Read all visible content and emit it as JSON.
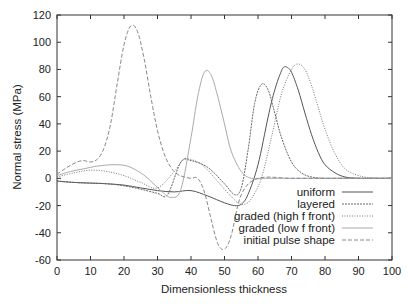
{
  "chart_data": {
    "type": "line",
    "title": "",
    "xlabel": "Dimensionless thickness",
    "ylabel": "Normal stress (MPa)",
    "xlim": [
      0,
      100
    ],
    "ylim": [
      -60,
      120
    ],
    "xticks": [
      0,
      10,
      20,
      30,
      40,
      50,
      60,
      70,
      80,
      90,
      100
    ],
    "yticks": [
      -60,
      -40,
      -20,
      0,
      20,
      40,
      60,
      80,
      100,
      120
    ],
    "grid": false,
    "legend_position": "lower right",
    "series": [
      {
        "name": "uniform",
        "style": "solid",
        "color": "#555555",
        "x": [
          0,
          5,
          10,
          15,
          20,
          25,
          30,
          35,
          40,
          45,
          50,
          53,
          55,
          57,
          60,
          63,
          65,
          67,
          68,
          69,
          70,
          72,
          74,
          76,
          78,
          80,
          83,
          86,
          90,
          95,
          100
        ],
        "y": [
          -2,
          -3,
          -3.5,
          -4,
          -5,
          -7,
          -9,
          -10,
          -9,
          -13,
          -18,
          -20,
          -19,
          -12,
          10,
          45,
          65,
          79,
          82,
          81,
          78,
          65,
          48,
          32,
          19,
          10,
          4,
          1,
          0,
          0,
          0
        ]
      },
      {
        "name": "layered",
        "style": "dashed-fine",
        "color": "#666666",
        "x": [
          0,
          5,
          10,
          15,
          20,
          25,
          30,
          33,
          37,
          40,
          45,
          50,
          53,
          55,
          57,
          59,
          61,
          63,
          65,
          67,
          70,
          73,
          76,
          80,
          85,
          90,
          100
        ],
        "y": [
          -2,
          -3,
          -3.5,
          -4,
          -5.5,
          -8,
          -11,
          -12,
          12,
          13,
          8,
          -4,
          -12,
          -7,
          20,
          55,
          69,
          65,
          48,
          30,
          12,
          4,
          1,
          0,
          0,
          0,
          0
        ]
      },
      {
        "name": "graded (high f front)",
        "style": "dotted",
        "color": "#777777",
        "x": [
          0,
          5,
          10,
          15,
          20,
          25,
          30,
          35,
          38,
          42,
          45,
          50,
          54,
          56,
          58,
          61,
          64,
          67,
          70,
          72,
          74,
          76,
          78,
          80,
          83,
          86,
          90,
          95,
          100
        ],
        "y": [
          1,
          4,
          6,
          5,
          2,
          -3,
          -7,
          5,
          14,
          12,
          6,
          -8,
          -18,
          -19,
          -15,
          0,
          30,
          62,
          80,
          84,
          80,
          68,
          52,
          36,
          18,
          7,
          2,
          0,
          0
        ]
      },
      {
        "name": "graded (low f front)",
        "style": "solid-light",
        "color": "#aaaaaa",
        "x": [
          0,
          4,
          8,
          12,
          17,
          21,
          25,
          28,
          31,
          34,
          37,
          40,
          42,
          44,
          46,
          48,
          50,
          52,
          55,
          58,
          62,
          66,
          70,
          75,
          80,
          90,
          100
        ],
        "y": [
          2,
          5,
          7,
          9,
          10,
          9,
          4,
          -2,
          -9,
          -14,
          -8,
          30,
          60,
          78,
          76,
          60,
          40,
          20,
          5,
          0,
          0,
          0,
          0,
          0,
          0,
          0,
          0
        ]
      },
      {
        "name": "initial pulse shape",
        "style": "dashed",
        "color": "#888888",
        "x": [
          0,
          3,
          6,
          8,
          10,
          12,
          14,
          16,
          18,
          20,
          22,
          24,
          26,
          28,
          30,
          32,
          34,
          36,
          38,
          40,
          42,
          44,
          46,
          48,
          50,
          52,
          55,
          60,
          70,
          80,
          90,
          100
        ],
        "y": [
          3,
          8,
          12,
          13,
          12,
          14,
          22,
          40,
          70,
          98,
          112,
          108,
          88,
          60,
          35,
          18,
          8,
          3,
          1,
          0,
          0,
          -10,
          -30,
          -48,
          -52,
          -42,
          -12,
          0,
          0,
          0,
          0,
          0
        ]
      }
    ]
  }
}
